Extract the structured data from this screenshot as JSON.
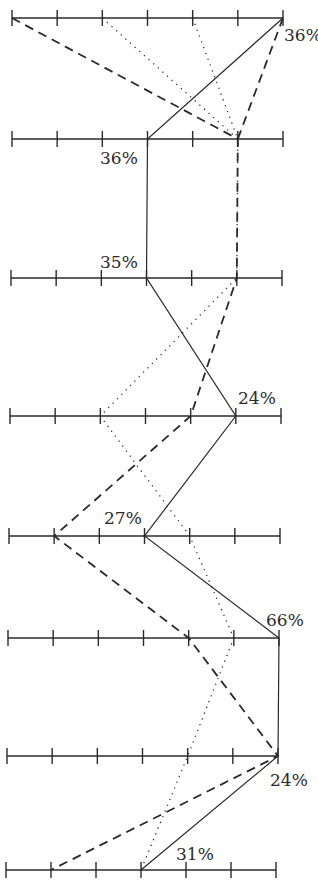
{
  "chart_data": {
    "type": "parallel-coordinates",
    "title": "",
    "xlabel": "",
    "ylabel": "",
    "ticks_per_axis": 7,
    "grid": false,
    "legend": null,
    "axes": [
      {
        "name": "axis-1",
        "y": 18,
        "x_start": 12,
        "x_end": 283
      },
      {
        "name": "axis-2",
        "y": 139,
        "x_start": 12,
        "x_end": 283
      },
      {
        "name": "axis-3",
        "y": 278,
        "x_start": 11,
        "x_end": 282
      },
      {
        "name": "axis-4",
        "y": 416,
        "x_start": 10,
        "x_end": 281
      },
      {
        "name": "axis-5",
        "y": 536,
        "x_start": 9,
        "x_end": 280
      },
      {
        "name": "axis-6",
        "y": 638,
        "x_start": 8,
        "x_end": 279
      },
      {
        "name": "axis-7",
        "y": 756,
        "x_start": 7,
        "x_end": 278
      },
      {
        "name": "axis-8",
        "y": 870,
        "x_start": 6,
        "x_end": 276
      }
    ],
    "series": [
      {
        "name": "solid",
        "style": "solid",
        "values": [
          6,
          3,
          3,
          5,
          3,
          6,
          6,
          3
        ]
      },
      {
        "name": "dashed",
        "style": "dashed",
        "values": [
          0,
          5,
          5,
          4,
          1,
          4,
          6,
          1
        ]
      },
      {
        "name": "dashed-b",
        "style": "dashed",
        "values": [
          6,
          5
        ]
      },
      {
        "name": "dash-dot",
        "style": "dashdot",
        "values": [
          2,
          5,
          5,
          2,
          4,
          5,
          4,
          3
        ]
      },
      {
        "name": "dash-dot-b",
        "style": "dashdot",
        "values": [
          4,
          5
        ]
      }
    ],
    "annotations": [
      {
        "text": "36%",
        "x": 284,
        "y": 41
      },
      {
        "text": "36%",
        "x": 100,
        "y": 164
      },
      {
        "text": "35%",
        "x": 100,
        "y": 268
      },
      {
        "text": "24%",
        "x": 238,
        "y": 404
      },
      {
        "text": "27%",
        "x": 104,
        "y": 524
      },
      {
        "text": "66%",
        "x": 266,
        "y": 626
      },
      {
        "text": "24%",
        "x": 270,
        "y": 786
      },
      {
        "text": "31%",
        "x": 176,
        "y": 860
      }
    ]
  }
}
